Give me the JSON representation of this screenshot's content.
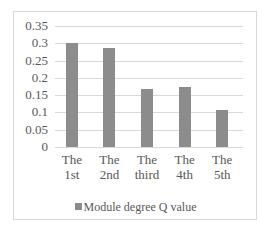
{
  "chart_data": {
    "type": "bar",
    "title": "",
    "xlabel": "",
    "ylabel": "",
    "categories": [
      "The 1st",
      "The 2nd",
      "The third",
      "The 4th",
      "The 5th"
    ],
    "category_lines": [
      [
        "The",
        "1st"
      ],
      [
        "The",
        "2nd"
      ],
      [
        "The",
        "third"
      ],
      [
        "The",
        "4th"
      ],
      [
        "The",
        "5th"
      ]
    ],
    "series": [
      {
        "name": "Module degree Q value",
        "values": [
          0.3,
          0.285,
          0.168,
          0.173,
          0.108
        ],
        "color": "#8c8c8c"
      }
    ],
    "ylim": [
      0,
      0.35
    ],
    "yticks": [
      "0",
      "0.05",
      "0.1",
      "0.15",
      "0.2",
      "0.25",
      "0.3",
      "0.35"
    ],
    "grid": true,
    "legend_position": "bottom"
  },
  "legend": {
    "label": "Module degree Q value"
  }
}
